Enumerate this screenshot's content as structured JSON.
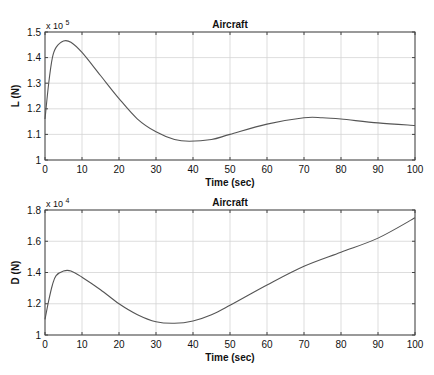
{
  "chart_data": [
    {
      "type": "line",
      "title": "Aircraft",
      "xlabel": "Time (sec)",
      "ylabel": "L (N)",
      "y_multiplier": "x 10",
      "y_exponent": "5",
      "xlim": [
        0,
        100
      ],
      "ylim": [
        1.0,
        1.5
      ],
      "xticks": [
        0,
        10,
        20,
        30,
        40,
        50,
        60,
        70,
        80,
        90,
        100
      ],
      "yticks": [
        1,
        1.1,
        1.2,
        1.3,
        1.4,
        1.5
      ],
      "ytick_labels": [
        "1",
        "1.1",
        "1.2",
        "1.3",
        "1.4",
        "1.5"
      ],
      "grid": true,
      "line_color": "#555555",
      "series": [
        {
          "name": "L",
          "x": [
            0,
            1,
            2,
            3,
            5,
            7,
            10,
            15,
            20,
            25,
            30,
            35,
            39,
            45,
            50,
            60,
            70,
            75,
            80,
            90,
            100
          ],
          "values": [
            1.16,
            1.3,
            1.4,
            1.44,
            1.465,
            1.46,
            1.42,
            1.33,
            1.24,
            1.16,
            1.11,
            1.08,
            1.073,
            1.08,
            1.1,
            1.14,
            1.165,
            1.165,
            1.16,
            1.145,
            1.135
          ]
        }
      ]
    },
    {
      "type": "line",
      "title": "Aircraft",
      "xlabel": "Time (sec)",
      "ylabel": "D (N)",
      "y_multiplier": "x 10",
      "y_exponent": "4",
      "xlim": [
        0,
        100
      ],
      "ylim": [
        1.0,
        1.8
      ],
      "xticks": [
        0,
        10,
        20,
        30,
        40,
        50,
        60,
        70,
        80,
        90,
        100
      ],
      "yticks": [
        1,
        1.2,
        1.4,
        1.6,
        1.8
      ],
      "ytick_labels": [
        "1",
        "1.2",
        "1.4",
        "1.6",
        "1.8"
      ],
      "grid": true,
      "line_color": "#555555",
      "series": [
        {
          "name": "D",
          "x": [
            0,
            1,
            2,
            3,
            5,
            7,
            10,
            15,
            20,
            25,
            30,
            35,
            40,
            45,
            50,
            60,
            70,
            80,
            90,
            100
          ],
          "values": [
            1.1,
            1.22,
            1.32,
            1.38,
            1.41,
            1.41,
            1.37,
            1.29,
            1.2,
            1.13,
            1.085,
            1.075,
            1.09,
            1.13,
            1.19,
            1.32,
            1.44,
            1.53,
            1.62,
            1.75
          ]
        }
      ]
    }
  ]
}
